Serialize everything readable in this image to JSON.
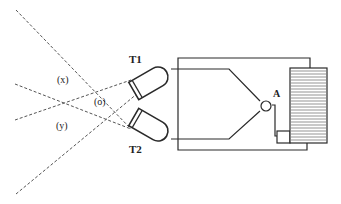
{
  "diagram": {
    "sensors": [
      {
        "id": "T1",
        "label": "T1"
      },
      {
        "id": "T2",
        "label": "T2"
      }
    ],
    "zones": [
      {
        "id": "x",
        "label": "(x)"
      },
      {
        "id": "o",
        "label": "(o)"
      },
      {
        "id": "y",
        "label": "(y)"
      }
    ],
    "node": {
      "id": "A",
      "label": "A"
    },
    "colors": {
      "line": "#2a2a2a",
      "dashed": "#555555",
      "coil_fill": "#d8d8d8",
      "background": "#ffffff"
    }
  }
}
